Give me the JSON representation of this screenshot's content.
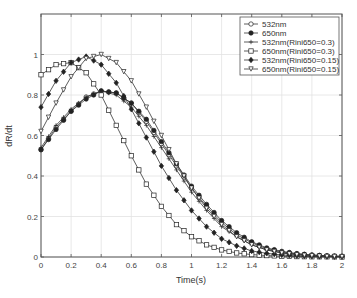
{
  "chart_data": {
    "type": "line",
    "title": "",
    "xlabel": "Time(s)",
    "ylabel": "dR/dt",
    "xlim": [
      0,
      2
    ],
    "ylim": [
      0,
      1.2
    ],
    "xticks": [
      "0",
      "0.2",
      "0.4",
      "0.6",
      "0.8",
      "1",
      "1.2",
      "1.4",
      "1.6",
      "1.8",
      "2"
    ],
    "yticks": [
      "0",
      "0.2",
      "0.4",
      "0.6",
      "0.8",
      "1"
    ],
    "grid": true,
    "legend_position": "upper right",
    "x": [
      0,
      0.1,
      0.2,
      0.3,
      0.4,
      0.5,
      0.6,
      0.7,
      0.8,
      0.9,
      1.0,
      1.1,
      1.2,
      1.3,
      1.4,
      1.5,
      1.6,
      1.7,
      1.8,
      1.9,
      2.0
    ],
    "series": [
      {
        "name": "532nm",
        "marker": "circle",
        "values": [
          0.53,
          0.64,
          0.72,
          0.79,
          0.82,
          0.81,
          0.76,
          0.67,
          0.56,
          0.45,
          0.34,
          0.25,
          0.17,
          0.11,
          0.07,
          0.04,
          0.025,
          0.015,
          0.01,
          0.005,
          0.003
        ]
      },
      {
        "name": "650nm",
        "marker": "dot",
        "values": [
          0.53,
          0.63,
          0.72,
          0.78,
          0.82,
          0.81,
          0.76,
          0.68,
          0.57,
          0.46,
          0.35,
          0.26,
          0.18,
          0.12,
          0.075,
          0.045,
          0.028,
          0.017,
          0.01,
          0.006,
          0.004
        ]
      },
      {
        "name": "532nm(Rini650=0.3)",
        "marker": "plus",
        "values": [
          0.54,
          0.65,
          0.73,
          0.79,
          0.82,
          0.8,
          0.74,
          0.65,
          0.54,
          0.43,
          0.32,
          0.23,
          0.15,
          0.1,
          0.06,
          0.035,
          0.02,
          0.012,
          0.007,
          0.004,
          0.002
        ]
      },
      {
        "name": "650nm(Rini650=0.3)",
        "marker": "square",
        "values": [
          0.9,
          0.95,
          0.96,
          0.91,
          0.8,
          0.65,
          0.5,
          0.36,
          0.25,
          0.16,
          0.1,
          0.06,
          0.035,
          0.02,
          0.012,
          0.007,
          0.004,
          0.002,
          0.001,
          0.001,
          0.0
        ]
      },
      {
        "name": "532nm(Rini650=0.15)",
        "marker": "star",
        "values": [
          0.74,
          0.87,
          0.96,
          0.99,
          0.95,
          0.86,
          0.73,
          0.59,
          0.45,
          0.33,
          0.23,
          0.15,
          0.09,
          0.055,
          0.03,
          0.018,
          0.01,
          0.006,
          0.003,
          0.002,
          0.001
        ]
      },
      {
        "name": "650nm(Rini650=0.15)",
        "marker": "triangle-down",
        "values": [
          0.62,
          0.76,
          0.89,
          0.98,
          1.0,
          0.96,
          0.87,
          0.74,
          0.6,
          0.46,
          0.34,
          0.24,
          0.16,
          0.1,
          0.06,
          0.035,
          0.02,
          0.011,
          0.006,
          0.003,
          0.002
        ]
      }
    ]
  }
}
